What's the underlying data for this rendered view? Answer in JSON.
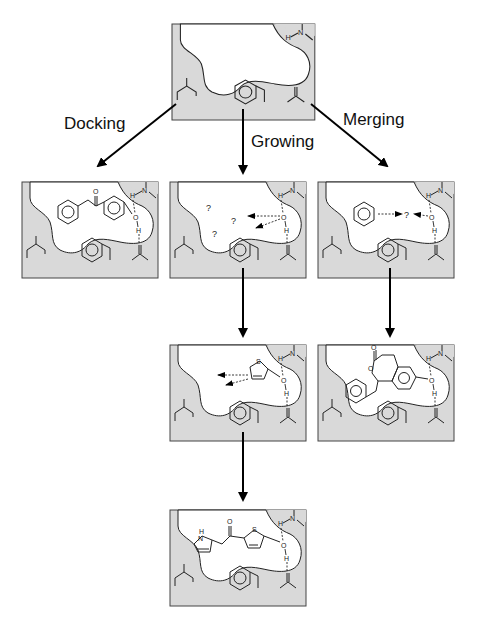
{
  "diagram": {
    "type": "fragment-based drug design strategies",
    "labels": {
      "docking": "Docking",
      "growing": "Growing",
      "merging": "Merging"
    },
    "atoms": {
      "N": "N",
      "H": "H",
      "O": "O",
      "S": "S",
      "NH": "H",
      "question": "?"
    },
    "panels": [
      {
        "id": "empty-pocket",
        "description": "Empty binding pocket with isobutyl, ethylphenyl, carbonyl and NH groups"
      },
      {
        "id": "docking-result",
        "description": "Docked ligand: phenyl-CH2-C(=O)-phenyl-OH hydrogen bonded to NH and C=O"
      },
      {
        "id": "growing-start",
        "description": "Hydroxyl fragment with growth vectors toward unknown sites (?)"
      },
      {
        "id": "merging-start",
        "description": "Benzene fragment and hydroxyl fragment to be merged (?)"
      },
      {
        "id": "growing-step2",
        "description": "Thiophene-OH fragment with growth vectors"
      },
      {
        "id": "merging-result",
        "description": "Merged ligand: benzyl-substituted isochromanone with phenol OH"
      },
      {
        "id": "growing-result",
        "description": "Grown ligand: pyrrole-CH2-C(=O)-thiophene-OH"
      }
    ],
    "colors": {
      "protein_fill": "#d9d9d9",
      "outline": "#333333",
      "arrow": "#000000",
      "background": "#ffffff"
    }
  }
}
